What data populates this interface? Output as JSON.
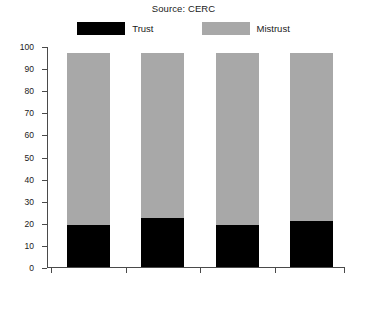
{
  "chart_data": {
    "type": "bar",
    "subtype": "stacked-bar",
    "title": "Source: CERC",
    "xlabel": "",
    "ylabel": "",
    "ylim": [
      0,
      100
    ],
    "yticks": [
      0,
      10,
      20,
      30,
      40,
      50,
      60,
      70,
      80,
      90,
      100
    ],
    "grid": false,
    "legend_position": "top-center",
    "categories": [
      "1988",
      "1990",
      "1995",
      "1996"
    ],
    "series": [
      {
        "name": "Trust",
        "color": "#000000",
        "values": [
          19,
          22,
          19,
          21
        ]
      },
      {
        "name": "Mistrust",
        "color": "#a8a8a8",
        "values": [
          78,
          75,
          78,
          76
        ]
      }
    ],
    "totals": [
      97,
      97,
      97,
      97
    ]
  },
  "legend": {
    "items": [
      {
        "label": "Trust",
        "color": "#000000"
      },
      {
        "label": "Mistrust",
        "color": "#a8a8a8"
      }
    ]
  },
  "axes": {
    "y_tick_labels": [
      "100",
      "90",
      "80",
      "70",
      "60",
      "50",
      "40",
      "30",
      "20",
      "10",
      "0"
    ],
    "x_tick_labels": [
      "1988",
      "1990",
      "1995",
      "1996"
    ]
  }
}
